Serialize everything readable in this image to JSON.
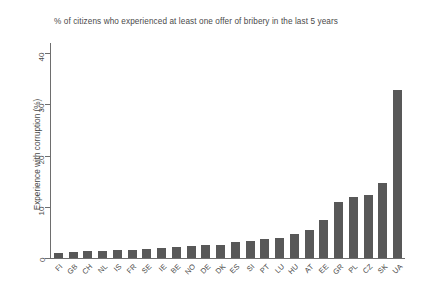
{
  "chart_data": {
    "type": "bar",
    "title": "% of citizens who experienced at least one offer of bribery in the last 5 years",
    "xlabel": "",
    "ylabel": "Experience with corruption (%)",
    "ylim": [
      0,
      42
    ],
    "yticks": [
      0,
      10,
      20,
      30,
      40
    ],
    "grid": false,
    "legend": null,
    "bar_color": "#585858",
    "axis_color": "#6e6e6e",
    "categories": [
      "FI",
      "GB",
      "CH",
      "NL",
      "IS",
      "FR",
      "SE",
      "IE",
      "BE",
      "NO",
      "DE",
      "DK",
      "ES",
      "SI",
      "PT",
      "LU",
      "HU",
      "AT",
      "EE",
      "GR",
      "PL",
      "CZ",
      "SK",
      "UA"
    ],
    "values": [
      1.0,
      1.2,
      1.3,
      1.4,
      1.5,
      1.6,
      1.8,
      2.0,
      2.1,
      2.3,
      2.5,
      2.6,
      3.2,
      3.4,
      3.7,
      4.0,
      4.6,
      5.5,
      7.5,
      11.0,
      12.0,
      12.4,
      14.6,
      32.8
    ]
  }
}
